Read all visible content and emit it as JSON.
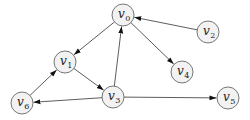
{
  "diagram": {
    "type": "directed-graph",
    "node_radius": 11,
    "colors": {
      "node_fill": "#f2f2f2",
      "node_stroke": "#555555",
      "edge": "#333333",
      "arrow": "#111111"
    },
    "nodes": [
      {
        "id": "v0",
        "label": "v",
        "sub": "0",
        "x": 123,
        "y": 15
      },
      {
        "id": "v1",
        "label": "v",
        "sub": "1",
        "x": 65,
        "y": 62
      },
      {
        "id": "v2",
        "label": "v",
        "sub": "2",
        "x": 208,
        "y": 32
      },
      {
        "id": "v3",
        "label": "v",
        "sub": "3",
        "x": 113,
        "y": 97
      },
      {
        "id": "v4",
        "label": "v",
        "sub": "4",
        "x": 182,
        "y": 72
      },
      {
        "id": "v5",
        "label": "v",
        "sub": "5",
        "x": 228,
        "y": 98
      },
      {
        "id": "v6",
        "label": "v",
        "sub": "6",
        "x": 22,
        "y": 103
      }
    ],
    "edges": [
      {
        "from": "v0",
        "to": "v1"
      },
      {
        "from": "v2",
        "to": "v0"
      },
      {
        "from": "v0",
        "to": "v4"
      },
      {
        "from": "v3",
        "to": "v0"
      },
      {
        "from": "v1",
        "to": "v3"
      },
      {
        "from": "v6",
        "to": "v1"
      },
      {
        "from": "v3",
        "to": "v6"
      },
      {
        "from": "v3",
        "to": "v5"
      }
    ]
  }
}
